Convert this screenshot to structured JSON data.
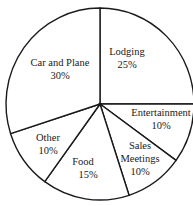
{
  "chart_data": {
    "type": "pie",
    "title": "",
    "start_angle_deg": 0,
    "direction": "clockwise",
    "categories": [
      "Lodging",
      "Entertainment",
      "Sales Meetings",
      "Food",
      "Other",
      "Car and Plane"
    ],
    "values": [
      25,
      10,
      10,
      15,
      10,
      30
    ],
    "units": "%",
    "slices": [
      {
        "label": "Lodging",
        "value": 25,
        "text": "25%"
      },
      {
        "label": "Entertainment",
        "value": 10,
        "text": "10%"
      },
      {
        "label": "Sales Meetings",
        "value": 10,
        "text": "10%"
      },
      {
        "label": "Food",
        "value": 15,
        "text": "15%"
      },
      {
        "label": "Other",
        "value": 10,
        "text": "10%"
      },
      {
        "label": "Car and Plane",
        "value": 30,
        "text": "30%"
      }
    ],
    "legend": "none",
    "colors": {
      "fill": "#ffffff",
      "stroke": "#1a1a1a"
    }
  },
  "labels": {
    "lodging": {
      "name": "Lodging",
      "pct": "25%"
    },
    "entertainment": {
      "name": "Entertainment",
      "pct": "10%"
    },
    "sales_meetings": {
      "name1": "Sales",
      "name2": "Meetings",
      "pct": "10%"
    },
    "food": {
      "name": "Food",
      "pct": "15%"
    },
    "other": {
      "name": "Other",
      "pct": "10%"
    },
    "car_and_plane": {
      "name": "Car and Plane",
      "pct": "30%"
    }
  }
}
